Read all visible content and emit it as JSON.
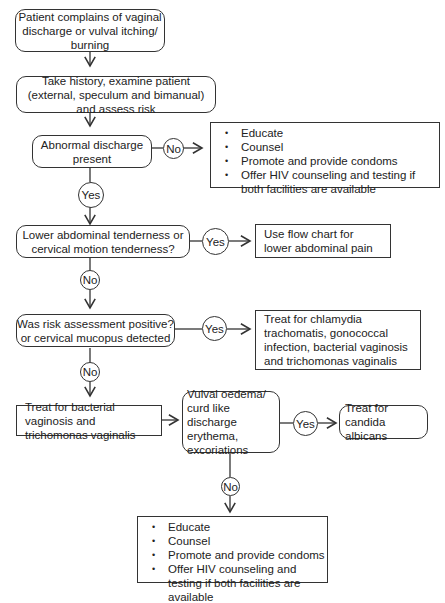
{
  "nodes": {
    "start": "Patient complains of vaginal discharge or vulval itching/ burning",
    "history": "Take history, examine patient (external, speculum and bimanual) and assess risk",
    "abnormal": "Abnormal discharge present",
    "lower_abd": "Lower abdominal tenderness or cervical motion tenderness?",
    "lower_abd_yes": "Use flow chart for lower abdominal pain",
    "risk": "Was risk assessment positive? or cervical mucopus detected",
    "risk_yes": "Treat for chlamydia trachomatis, gonococcal infection, bacterial vaginosis and trichomonas vaginalis",
    "treat_bv": "Treat for bacterial vaginosis and trichomonas vaginalis",
    "vulval": "Vulval oedema/ curd like discharge erythema, excoriations",
    "candida": "Treat for candida albicans"
  },
  "advice_top": [
    "Educate",
    "Counsel",
    "Promote and provide condoms",
    "Offer HIV counseling and testing if both facilities are available"
  ],
  "advice_bottom": [
    "Educate",
    "Counsel",
    "Promote and provide condoms",
    "Offer HIV counseling and testing if both facilities are available"
  ],
  "labels": {
    "yes": "Yes",
    "no": "No"
  }
}
